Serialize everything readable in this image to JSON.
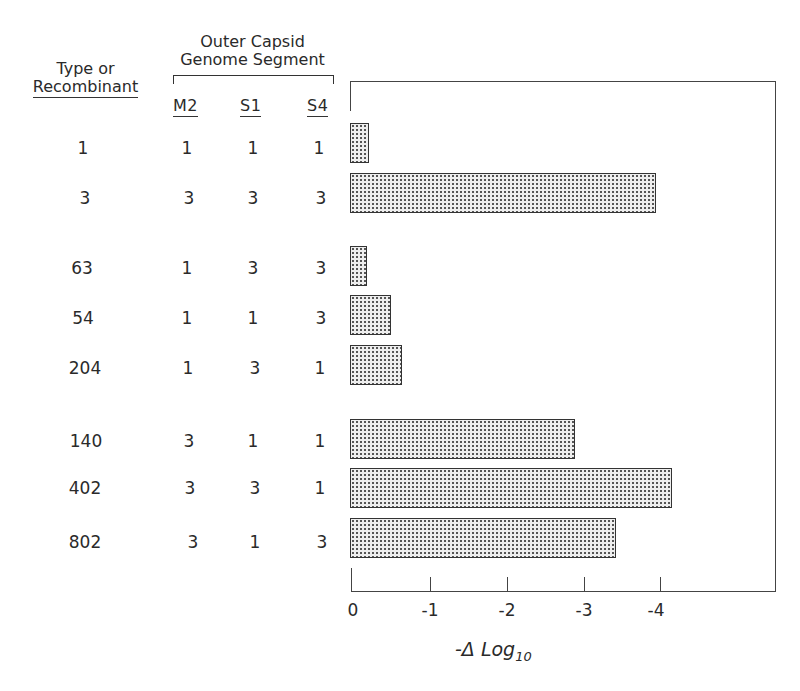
{
  "headers": {
    "type_col": [
      "Type or",
      "Recombinant"
    ],
    "group_title": [
      "Outer Capsid",
      "Genome Segment"
    ],
    "segments": [
      "M2",
      "S1",
      "S4"
    ]
  },
  "rows": [
    {
      "type": "1",
      "M2": "1",
      "S1": "1",
      "S4": "1"
    },
    {
      "type": "3",
      "M2": "3",
      "S1": "3",
      "S4": "3"
    },
    {
      "type": "63",
      "M2": "1",
      "S1": "3",
      "S4": "3"
    },
    {
      "type": "54",
      "M2": "1",
      "S1": "1",
      "S4": "3"
    },
    {
      "type": "204",
      "M2": "1",
      "S1": "3",
      "S4": "1"
    },
    {
      "type": "140",
      "M2": "3",
      "S1": "1",
      "S4": "1"
    },
    {
      "type": "402",
      "M2": "3",
      "S1": "3",
      "S4": "1"
    },
    {
      "type": "802",
      "M2": "3",
      "S1": "1",
      "S4": "3"
    }
  ],
  "axis": {
    "ticks": [
      "0",
      "-1",
      "-2",
      "-3",
      "-4"
    ],
    "label_main": "-Δ Log",
    "label_sub": "10"
  },
  "chart_data": {
    "type": "bar",
    "orientation": "horizontal",
    "title": "",
    "categories": [
      "1",
      "3",
      "63",
      "54",
      "204",
      "140",
      "402",
      "802"
    ],
    "values": [
      -0.22,
      -3.95,
      -0.19,
      -0.5,
      -0.65,
      -2.9,
      -4.15,
      -3.43
    ],
    "magnitudes": [
      0.22,
      3.95,
      0.19,
      0.5,
      0.65,
      2.9,
      4.15,
      3.43
    ],
    "xlabel": "-Δ Log10",
    "ylabel": "Type or Recombinant",
    "xlim": [
      0,
      -5.6
    ],
    "xticks": [
      0,
      -1,
      -2,
      -3,
      -4
    ],
    "grid": false,
    "legend": null,
    "groups": [
      [
        "1",
        "3"
      ],
      [
        "63",
        "54",
        "204"
      ],
      [
        "140",
        "402",
        "802"
      ]
    ],
    "table_columns": {
      "title": "Outer Capsid Genome Segment",
      "M2": [
        "1",
        "3",
        "1",
        "1",
        "1",
        "3",
        "3",
        "3"
      ],
      "S1": [
        "1",
        "3",
        "3",
        "1",
        "3",
        "1",
        "3",
        "1"
      ],
      "S4": [
        "1",
        "3",
        "3",
        "3",
        "1",
        "1",
        "1",
        "3"
      ]
    },
    "fill": "stippled grey"
  }
}
